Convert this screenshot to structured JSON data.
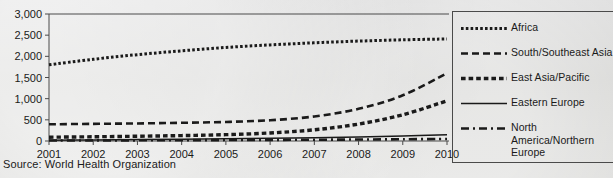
{
  "source_note": "Source: World Health Organization",
  "colors": {
    "ink": "#1a1a1a",
    "axis": "#4a4a4a",
    "background": "#d9d9d7"
  },
  "chart_data": {
    "type": "line",
    "title": "",
    "subtitle": "",
    "xlabel": "",
    "ylabel": "",
    "x": [
      2001,
      2002,
      2003,
      2004,
      2005,
      2006,
      2007,
      2008,
      2009,
      2010
    ],
    "xtick_labels": [
      "2001",
      "2002",
      "2003",
      "2004",
      "2005",
      "2006",
      "2007",
      "2008",
      "2009",
      "2010"
    ],
    "xlim": [
      2001,
      2010
    ],
    "ylim": [
      0,
      3000
    ],
    "ytick_values": [
      0,
      500,
      1000,
      1500,
      2000,
      2500,
      3000
    ],
    "ytick_labels": [
      "0",
      "500",
      "1,000",
      "1,500",
      "2,000",
      "2,500",
      "3,000"
    ],
    "grid": false,
    "legend_position": "right",
    "series": [
      {
        "name": "Africa",
        "line_style": "dotted",
        "values": [
          1800,
          1930,
          2040,
          2130,
          2210,
          2270,
          2320,
          2360,
          2390,
          2410
        ]
      },
      {
        "name": "South/Southeast Asia",
        "line_style": "dashed",
        "values": [
          395,
          405,
          415,
          430,
          450,
          490,
          580,
          760,
          1080,
          1600
        ]
      },
      {
        "name": "East Asia/Pacific",
        "line_style": "thick-dashed",
        "values": [
          90,
          100,
          112,
          128,
          150,
          190,
          265,
          400,
          620,
          950
        ]
      },
      {
        "name": "Eastern Europe",
        "line_style": "solid",
        "values": [
          20,
          26,
          33,
          41,
          51,
          63,
          78,
          96,
          118,
          145
        ]
      },
      {
        "name": "North America/Northern Europe",
        "line_style": "dash-dot",
        "values": [
          12,
          14,
          16,
          19,
          22,
          26,
          30,
          35,
          41,
          48
        ]
      }
    ]
  }
}
